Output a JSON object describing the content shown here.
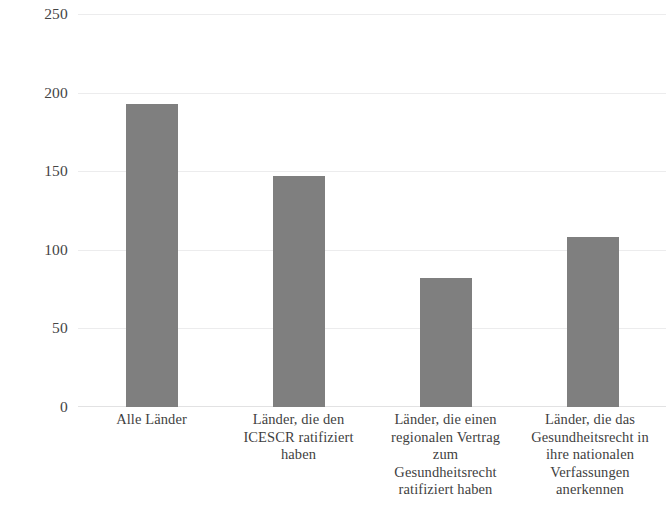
{
  "chart_data": {
    "type": "bar",
    "title": "",
    "subtitle": "",
    "xlabel": "",
    "ylabel": "",
    "ylim": [
      0,
      250
    ],
    "grid": true,
    "legend": false,
    "legend_position": "none",
    "bar_color": "#7f7f7f",
    "gridline_color": "#ececed",
    "background_color": "#ffffff",
    "yticks": [
      {
        "label": "250",
        "value": 250
      },
      {
        "label": "200",
        "value": 200
      },
      {
        "label": "150",
        "value": 150
      },
      {
        "label": "100",
        "value": 100
      },
      {
        "label": "50",
        "value": 50
      },
      {
        "label": "0",
        "value": 0
      }
    ],
    "categories": [
      "Alle Länder",
      "Länder, die den ICESCR ratifiziert haben",
      "Länder, die einen regionalen Vertrag zum Gesundheitsrecht ratifiziert haben",
      "Länder, die das Gesundheitsrecht in ihre nationalen Verfassungen anerkennen"
    ],
    "category_lines": [
      [
        "Alle Länder"
      ],
      [
        "Länder, die den",
        "ICESCR ratifiziert",
        "haben"
      ],
      [
        "Länder, die einen",
        "regionalen Vertrag",
        "zum",
        "Gesundheitsrecht",
        "ratifiziert haben"
      ],
      [
        "Länder, die das",
        "Gesundheitsrecht in",
        "ihre nationalen",
        "Verfassungen",
        "anerkennen"
      ]
    ],
    "values": [
      193,
      147,
      82,
      108
    ]
  }
}
